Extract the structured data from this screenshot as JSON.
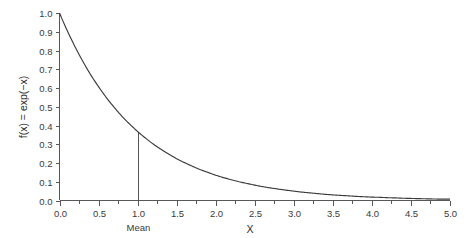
{
  "chart_data": {
    "type": "line",
    "title": "",
    "subtitle": "",
    "xlabel": "X",
    "ylabel": "f(x) = exp(−x)",
    "xlim": [
      0.0,
      5.0
    ],
    "ylim": [
      0.0,
      1.0
    ],
    "grid": false,
    "legend": false,
    "legend_position": "none",
    "x_ticks": [
      "0.0",
      "0.5",
      "1.0",
      "1.5",
      "2.0",
      "2.5",
      "3.0",
      "3.5",
      "4.0",
      "4.5",
      "5.0"
    ],
    "x_tick_values": [
      0.0,
      0.5,
      1.0,
      1.5,
      2.0,
      2.5,
      3.0,
      3.5,
      4.0,
      4.5,
      5.0
    ],
    "x_minor_tick_values": [
      0.25,
      0.75,
      1.25,
      1.75,
      2.25,
      2.75,
      3.25,
      3.75,
      4.25,
      4.75
    ],
    "y_ticks": [
      "1.0",
      "0.9",
      "0.8",
      "0.7",
      "0.6",
      "0.5",
      "0.4",
      "0.3",
      "0.2",
      "0.1",
      "0.0"
    ],
    "y_tick_values": [
      1.0,
      0.9,
      0.8,
      0.7,
      0.6,
      0.5,
      0.4,
      0.3,
      0.2,
      0.1,
      0.0
    ],
    "series": [
      {
        "name": "f(x) = exp(-x)",
        "color": "#3b3b3b",
        "x": [
          0.0,
          0.1,
          0.2,
          0.3,
          0.4,
          0.5,
          0.6,
          0.7,
          0.8,
          0.9,
          1.0,
          1.1,
          1.2,
          1.3,
          1.4,
          1.5,
          1.6,
          1.7,
          1.8,
          1.9,
          2.0,
          2.1,
          2.2,
          2.3,
          2.4,
          2.5,
          2.6,
          2.7,
          2.8,
          2.9,
          3.0,
          3.1,
          3.2,
          3.3,
          3.4,
          3.5,
          3.6,
          3.7,
          3.8,
          3.9,
          4.0,
          4.1,
          4.2,
          4.3,
          4.4,
          4.5,
          4.6,
          4.7,
          4.8,
          4.9,
          5.0
        ],
        "values": [
          1.0,
          0.905,
          0.819,
          0.741,
          0.67,
          0.607,
          0.549,
          0.497,
          0.449,
          0.407,
          0.368,
          0.333,
          0.301,
          0.273,
          0.247,
          0.223,
          0.202,
          0.183,
          0.165,
          0.15,
          0.135,
          0.122,
          0.111,
          0.1,
          0.091,
          0.082,
          0.074,
          0.067,
          0.061,
          0.055,
          0.05,
          0.045,
          0.041,
          0.037,
          0.033,
          0.03,
          0.027,
          0.025,
          0.022,
          0.02,
          0.018,
          0.017,
          0.015,
          0.014,
          0.012,
          0.011,
          0.01,
          0.009,
          0.008,
          0.007,
          0.007
        ]
      }
    ],
    "annotations": [
      {
        "name": "mean-reference-line",
        "label": "Mean",
        "x": 1.0,
        "y_from": 0.0,
        "y_to": 0.368,
        "color": "#555555"
      }
    ]
  },
  "colors": {
    "background": "#ffffff",
    "axis": "#585858",
    "curve": "#3b3b3b",
    "reference_line": "#555555",
    "text": "#3a3a3a"
  }
}
